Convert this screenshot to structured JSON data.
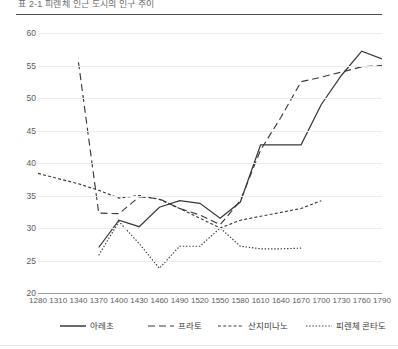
{
  "figure": {
    "title_fragment": "표 2-1   피렌체 인근 도시의 인구 추이",
    "accent_color": "#3a3a3a",
    "grid_color": "#ececec",
    "axis_color": "#9a9a9a"
  },
  "chart_data": {
    "type": "line",
    "title": "",
    "xlabel": "",
    "ylabel": "",
    "xlim": [
      1280,
      1790
    ],
    "ylim": [
      20,
      60
    ],
    "ytick_step": 5,
    "xtick_step": 30,
    "grid": true,
    "legend_position": "bottom",
    "xticks": [
      1280,
      1310,
      1340,
      1370,
      1400,
      1430,
      1460,
      1490,
      1520,
      1550,
      1580,
      1610,
      1640,
      1670,
      1700,
      1730,
      1760,
      1790
    ],
    "yticks": [
      20,
      25,
      30,
      35,
      40,
      45,
      50,
      55,
      60
    ],
    "series": [
      {
        "name": "아레초",
        "style": "solid",
        "points": [
          [
            1370,
            27.0
          ],
          [
            1400,
            31.2
          ],
          [
            1430,
            30.2
          ],
          [
            1460,
            33.2
          ],
          [
            1490,
            34.2
          ],
          [
            1520,
            33.8
          ],
          [
            1550,
            31.5
          ],
          [
            1580,
            34.0
          ],
          [
            1610,
            42.8
          ],
          [
            1640,
            42.8
          ],
          [
            1670,
            42.8
          ],
          [
            1700,
            49.0
          ],
          [
            1730,
            53.5
          ],
          [
            1760,
            57.2
          ],
          [
            1790,
            56.0
          ]
        ]
      },
      {
        "name": "프라토",
        "style": "dashed",
        "points": [
          [
            1340,
            55.5
          ],
          [
            1370,
            32.3
          ],
          [
            1400,
            32.2
          ],
          [
            1430,
            34.8
          ],
          [
            1460,
            34.5
          ],
          [
            1490,
            33.0
          ],
          [
            1520,
            32.0
          ],
          [
            1550,
            30.5
          ],
          [
            1580,
            34.2
          ],
          [
            1610,
            42.0
          ],
          [
            1640,
            47.0
          ],
          [
            1670,
            52.5
          ],
          [
            1700,
            53.2
          ],
          [
            1730,
            54.0
          ],
          [
            1760,
            54.8
          ],
          [
            1790,
            55.0
          ]
        ]
      },
      {
        "name": "산지미나노",
        "style": "fine-dashed",
        "points": [
          [
            1280,
            38.4
          ],
          [
            1310,
            37.6
          ],
          [
            1340,
            36.8
          ],
          [
            1370,
            35.8
          ],
          [
            1400,
            34.6
          ],
          [
            1430,
            35.0
          ],
          [
            1460,
            34.4
          ],
          [
            1490,
            33.0
          ],
          [
            1520,
            31.5
          ],
          [
            1550,
            30.0
          ],
          [
            1580,
            31.2
          ],
          [
            1610,
            31.8
          ],
          [
            1640,
            32.4
          ],
          [
            1670,
            33.0
          ],
          [
            1700,
            34.2
          ]
        ]
      },
      {
        "name": "피렌체 콘타도",
        "style": "dotted",
        "points": [
          [
            1370,
            25.8
          ],
          [
            1400,
            31.0
          ],
          [
            1430,
            27.6
          ],
          [
            1460,
            23.8
          ],
          [
            1490,
            27.2
          ],
          [
            1520,
            27.2
          ],
          [
            1550,
            30.0
          ],
          [
            1580,
            27.2
          ],
          [
            1610,
            26.8
          ],
          [
            1640,
            26.8
          ],
          [
            1670,
            26.9
          ]
        ]
      }
    ]
  },
  "legend": {
    "items": [
      {
        "label": "아레초",
        "style": "solid"
      },
      {
        "label": "프라토",
        "style": "dashed"
      },
      {
        "label": "산지미나노",
        "style": "fine-dashed"
      },
      {
        "label": "피렌체 콘타도",
        "style": "dotted"
      }
    ]
  }
}
